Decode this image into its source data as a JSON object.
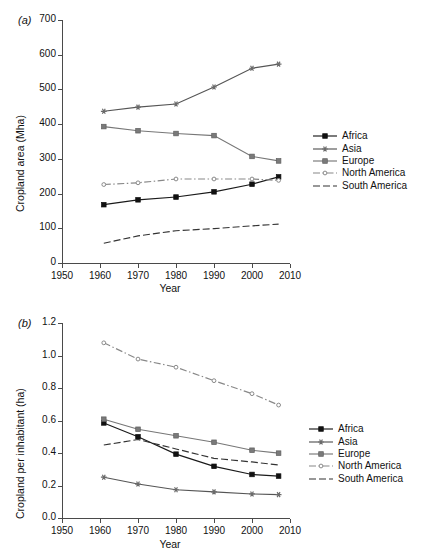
{
  "figure": {
    "panel_a_label": "(a)",
    "panel_b_label": "(b)"
  },
  "chart_data": [
    {
      "id": "panel_a",
      "type": "line",
      "title": "",
      "panel_label": "(a)",
      "xlabel": "Year",
      "ylabel": "Cropland area (Mha)",
      "xlim": [
        1950,
        2010
      ],
      "ylim": [
        0,
        700
      ],
      "xticks": [
        1950,
        1960,
        1970,
        1980,
        1990,
        2000,
        2010
      ],
      "xtick_labels": [
        "1950",
        "1960",
        "1970",
        "1980",
        "1990",
        "2000",
        "2010"
      ],
      "yticks": [
        0,
        100,
        200,
        300,
        400,
        500,
        600,
        700
      ],
      "ytick_labels": [
        "0",
        "100",
        "200",
        "300",
        "400",
        "500",
        "600",
        "700"
      ],
      "grid": false,
      "legend_position": "right",
      "x": [
        1961,
        1970,
        1980,
        1990,
        2000,
        2007
      ],
      "series": [
        {
          "name": "Africa",
          "values": [
            168,
            182,
            190,
            205,
            227,
            248
          ],
          "color": "#1a1a1a",
          "marker": "filled-square",
          "dash": "solid"
        },
        {
          "name": "Asia",
          "values": [
            437,
            449,
            458,
            507,
            561,
            573
          ],
          "color": "#555555",
          "marker": "star",
          "dash": "solid"
        },
        {
          "name": "Europe",
          "values": [
            393,
            381,
            373,
            367,
            307,
            294
          ],
          "color": "#777777",
          "marker": "filled-square-gray",
          "dash": "solid"
        },
        {
          "name": "North America",
          "values": [
            226,
            231,
            242,
            242,
            242,
            238
          ],
          "color": "#888888",
          "marker": "open-circle",
          "dash": "dashdot"
        },
        {
          "name": "South America",
          "values": [
            57,
            78,
            93,
            99,
            107,
            112
          ],
          "color": "#333333",
          "marker": "none",
          "dash": "dashed"
        }
      ]
    },
    {
      "id": "panel_b",
      "type": "line",
      "title": "",
      "panel_label": "(b)",
      "xlabel": "Year",
      "ylabel": "Cropland per inhabitant (ha)",
      "xlim": [
        1950,
        2010
      ],
      "ylim": [
        0.0,
        1.2
      ],
      "xticks": [
        1950,
        1960,
        1970,
        1980,
        1990,
        2000,
        2010
      ],
      "xtick_labels": [
        "1950",
        "1960",
        "1970",
        "1980",
        "1990",
        "2000",
        "2010"
      ],
      "yticks": [
        0.0,
        0.2,
        0.4,
        0.6,
        0.8,
        1.0,
        1.2
      ],
      "ytick_labels": [
        "0.0",
        "0.2",
        "0.4",
        "0.6",
        "0.8",
        "1.0",
        "1.2"
      ],
      "grid": false,
      "legend_position": "right",
      "x": [
        1961,
        1970,
        1980,
        1990,
        2000,
        2007
      ],
      "series": [
        {
          "name": "Africa",
          "values": [
            0.585,
            0.5,
            0.393,
            0.318,
            0.268,
            0.258
          ],
          "color": "#1a1a1a",
          "marker": "filled-square",
          "dash": "solid"
        },
        {
          "name": "Asia",
          "values": [
            0.251,
            0.209,
            0.174,
            0.161,
            0.148,
            0.144
          ],
          "color": "#555555",
          "marker": "star",
          "dash": "solid"
        },
        {
          "name": "Europe",
          "values": [
            0.608,
            0.546,
            0.506,
            0.466,
            0.417,
            0.399
          ],
          "color": "#777777",
          "marker": "filled-square-gray",
          "dash": "solid"
        },
        {
          "name": "North America",
          "values": [
            1.078,
            0.978,
            0.928,
            0.845,
            0.765,
            0.695
          ],
          "color": "#888888",
          "marker": "open-circle",
          "dash": "dashdot"
        },
        {
          "name": "South America",
          "values": [
            0.449,
            0.483,
            0.425,
            0.367,
            0.345,
            0.326
          ],
          "color": "#333333",
          "marker": "none",
          "dash": "dashed"
        }
      ]
    }
  ],
  "legend": {
    "items": [
      {
        "label": "Africa"
      },
      {
        "label": "Asia"
      },
      {
        "label": "Europe"
      },
      {
        "label": "North America"
      },
      {
        "label": "South America"
      }
    ]
  }
}
